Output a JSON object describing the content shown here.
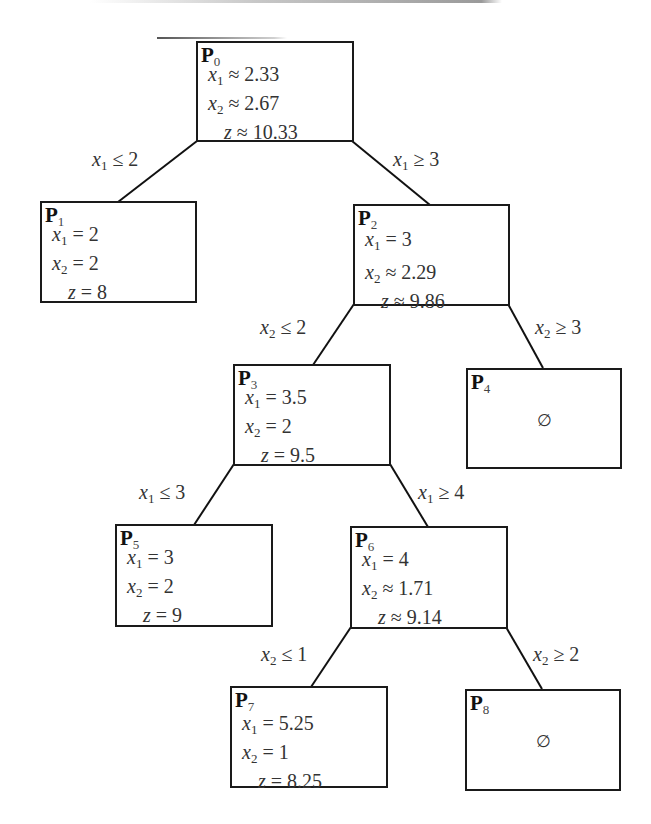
{
  "diagram": {
    "type": "branch-and-bound-tree",
    "nodes": [
      {
        "id": "P0",
        "label": "P",
        "index": "0",
        "x1": "≈ 2.33",
        "x2": "≈ 2.67",
        "z": "≈ 10.33",
        "empty": null
      },
      {
        "id": "P1",
        "label": "P",
        "index": "1",
        "x1": "= 2",
        "x2": "= 2",
        "z": "= 8",
        "empty": null
      },
      {
        "id": "P2",
        "label": "P",
        "index": "2",
        "x1": "= 3",
        "x2": "≈ 2.29",
        "z": "≈ 9.86",
        "empty": null
      },
      {
        "id": "P3",
        "label": "P",
        "index": "3",
        "x1": "= 3.5",
        "x2": "= 2",
        "z": "= 9.5",
        "empty": null
      },
      {
        "id": "P4",
        "label": "P",
        "index": "4",
        "x1": null,
        "x2": null,
        "z": null,
        "empty": "∅"
      },
      {
        "id": "P5",
        "label": "P",
        "index": "5",
        "x1": "= 3",
        "x2": "= 2",
        "z": "= 9",
        "empty": null
      },
      {
        "id": "P6",
        "label": "P",
        "index": "6",
        "x1": "= 4",
        "x2": "≈ 1.71",
        "z": "≈ 9.14",
        "empty": null
      },
      {
        "id": "P7",
        "label": "P",
        "index": "7",
        "x1": "= 5.25",
        "x2": "= 1",
        "z": "= 8.25",
        "empty": null
      },
      {
        "id": "P8",
        "label": "P",
        "index": "8",
        "x1": null,
        "x2": null,
        "z": null,
        "empty": "∅"
      }
    ],
    "edges": [
      {
        "from": "P0",
        "to": "P1",
        "var": "x",
        "var_index": "1",
        "rel": "≤ 2"
      },
      {
        "from": "P0",
        "to": "P2",
        "var": "x",
        "var_index": "1",
        "rel": "≥ 3"
      },
      {
        "from": "P2",
        "to": "P3",
        "var": "x",
        "var_index": "2",
        "rel": "≤ 2"
      },
      {
        "from": "P2",
        "to": "P4",
        "var": "x",
        "var_index": "2",
        "rel": "≥ 3"
      },
      {
        "from": "P3",
        "to": "P5",
        "var": "x",
        "var_index": "1",
        "rel": "≤ 3"
      },
      {
        "from": "P3",
        "to": "P6",
        "var": "x",
        "var_index": "1",
        "rel": "≥ 4"
      },
      {
        "from": "P6",
        "to": "P7",
        "var": "x",
        "var_index": "2",
        "rel": "≤ 1"
      },
      {
        "from": "P6",
        "to": "P8",
        "var": "x",
        "var_index": "2",
        "rel": "≥ 2"
      }
    ],
    "var_names": {
      "x": "x",
      "z": "z",
      "one": "1",
      "two": "2"
    }
  }
}
